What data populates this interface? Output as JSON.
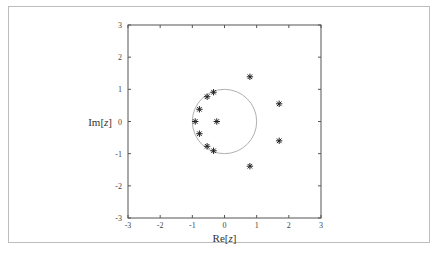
{
  "chart_data": {
    "type": "scatter",
    "title": "",
    "xlabel": "Re[z]",
    "ylabel": "Im[z]",
    "xlim": [
      -3,
      3
    ],
    "ylim": [
      -3,
      3
    ],
    "xticks": [
      -3,
      -2,
      -1,
      0,
      1,
      2,
      3
    ],
    "yticks": [
      -3,
      -2,
      -1,
      0,
      1,
      2,
      3
    ],
    "grid": false,
    "marker": "asterisk",
    "unit_circle": {
      "center": [
        0,
        0
      ],
      "radius": 1,
      "color": "#9a9a9a"
    },
    "series": [
      {
        "name": "points",
        "points": [
          {
            "x": -0.34,
            "y": 0.91
          },
          {
            "x": -0.54,
            "y": 0.77
          },
          {
            "x": -0.78,
            "y": 0.38
          },
          {
            "x": -0.91,
            "y": 0.0
          },
          {
            "x": -0.24,
            "y": 0.0
          },
          {
            "x": -0.78,
            "y": -0.38
          },
          {
            "x": -0.54,
            "y": -0.77
          },
          {
            "x": -0.34,
            "y": -0.91
          },
          {
            "x": 0.79,
            "y": 1.39
          },
          {
            "x": 1.7,
            "y": 0.55
          },
          {
            "x": 1.7,
            "y": -0.6
          },
          {
            "x": 0.79,
            "y": -1.39
          }
        ]
      }
    ]
  },
  "labels": {
    "xlabel_re": "Re[",
    "xlabel_var": "z",
    "xlabel_close": "]",
    "ylabel_im": "Im[",
    "ylabel_var": "z",
    "ylabel_close": "]"
  },
  "colors": {
    "axes": "#555555",
    "marker": "#222222",
    "circle": "#9a9a9a",
    "frame": "#bdbdbd"
  }
}
